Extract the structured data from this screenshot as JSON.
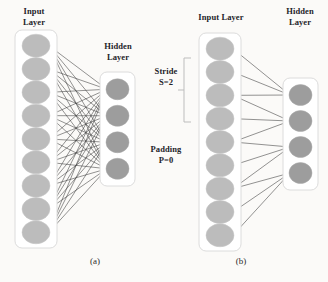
{
  "figure": {
    "caption_a": "(a)",
    "caption_b": "(b)",
    "background_color": "#fbfaf8"
  },
  "annotations": {
    "stride": "Stride\nS=2",
    "stride_name": "Stride",
    "stride_value": "S=2",
    "padding": "Padding\nP=0",
    "padding_name": "Padding",
    "padding_value": "P=0"
  },
  "colors": {
    "input_node": "#bcbcbc",
    "hidden_node": "#9d9d9d",
    "edge": "#3a3a3a",
    "box_border": "#dcdcdc",
    "box_fill": "#ffffff",
    "bracket": "#bdbdbd"
  },
  "diagram_a": {
    "name": "fully-connected",
    "input_layer": {
      "label": "Input\nLayer",
      "label_line1": "Input",
      "label_line2": "Layer",
      "node_count": 9
    },
    "hidden_layer": {
      "label": "Hidden\nLayer",
      "label_line1": "Hidden",
      "label_line2": "Layer",
      "node_count": 4
    },
    "connection_type": "dense",
    "edge_count": 36
  },
  "diagram_b": {
    "name": "strided-locally-connected",
    "input_layer": {
      "label": "Input Layer",
      "node_count": 9
    },
    "hidden_layer": {
      "label": "Hidden\nLayer",
      "label_line1": "Hidden",
      "label_line2": "Layer",
      "node_count": 4
    },
    "connection_type": "strided",
    "stride": 2,
    "padding": 0,
    "kernel_size": 3,
    "edge_count": 12,
    "receptive_fields": [
      [
        0,
        1,
        2
      ],
      [
        2,
        3,
        4
      ],
      [
        4,
        5,
        6
      ],
      [
        6,
        7,
        8
      ]
    ]
  },
  "chart_data": {
    "type": "diagram",
    "panels": [
      {
        "id": "a",
        "caption": "(a)",
        "input_nodes": 9,
        "hidden_nodes": 4,
        "connectivity": "full",
        "edges": 36
      },
      {
        "id": "b",
        "caption": "(b)",
        "input_nodes": 9,
        "hidden_nodes": 4,
        "connectivity": "strided",
        "stride": 2,
        "padding": 0,
        "kernel": 3,
        "edges": 12
      }
    ]
  }
}
